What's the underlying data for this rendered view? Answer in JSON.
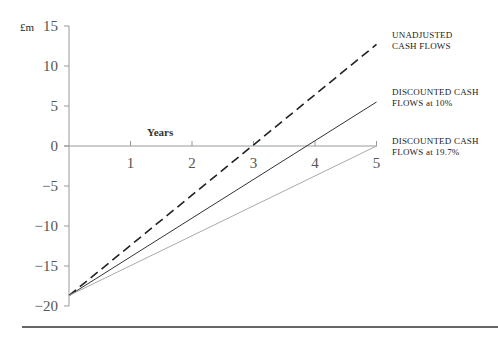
{
  "chart_data": {
    "type": "line",
    "title": "",
    "ylabel": "£m",
    "xlabel": "Years",
    "x": [
      0,
      1,
      2,
      3,
      4,
      5
    ],
    "x_ticks": [
      "1",
      "2",
      "3",
      "4",
      "5"
    ],
    "y_ticks": [
      "15",
      "10",
      "5",
      "0",
      "−5",
      "−10",
      "−15",
      "−20"
    ],
    "ylim": [
      -20,
      15
    ],
    "xlim": [
      0,
      5
    ],
    "grid": false,
    "series": [
      {
        "name": "UNADJUSTED CASH FLOWS",
        "style": "dashed",
        "values": [
          -18.7,
          -12.4,
          -6.2,
          0.1,
          6.4,
          12.7
        ]
      },
      {
        "name": "DISCOUNTED CASH FLOWS at 10%",
        "style": "solid",
        "values": [
          -18.7,
          -13.9,
          -9.0,
          -4.2,
          0.7,
          5.5
        ]
      },
      {
        "name": "DISCOUNTED CASH FLOWS at 19.7%",
        "style": "solid-light",
        "values": [
          -18.7,
          -15.0,
          -11.2,
          -7.5,
          -3.7,
          0.0
        ]
      }
    ],
    "legend_position": "right (inline labels)"
  },
  "labels": {
    "unit": "£m",
    "years": "Years",
    "unadjusted_1": "UNADJUSTED",
    "unadjusted_2": "CASH FLOWS",
    "disc10_1": "DISCOUNTED CASH",
    "disc10_2": "FLOWS at 10%",
    "disc197_1": "DISCOUNTED CASH",
    "disc197_2": "FLOWS at 19.7%"
  }
}
